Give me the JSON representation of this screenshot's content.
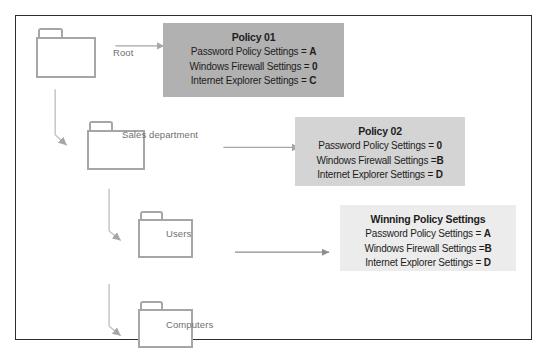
{
  "diagram": {
    "frame": {
      "border_color": "#2c2c2c",
      "background": "#ffffff"
    }
  },
  "tree": {
    "nodes": [
      {
        "id": "root",
        "icon": "folder-icon",
        "label": "Root"
      },
      {
        "id": "sales",
        "icon": "folder-icon",
        "label": "Sales department"
      },
      {
        "id": "users",
        "icon": "folder-icon",
        "label": "Users"
      },
      {
        "id": "computers",
        "icon": "folder-icon",
        "label": "Computers"
      }
    ]
  },
  "boxes": [
    {
      "id": "policy01",
      "title": "Policy 01",
      "background": "#b1b1b1",
      "lines": [
        {
          "setting": "Password Policy Settings = ",
          "value": "A"
        },
        {
          "setting": "Windows Firewall Settings = ",
          "value": "0"
        },
        {
          "setting": "Internet Explorer Settings = ",
          "value": "C"
        }
      ]
    },
    {
      "id": "policy02",
      "title": "Policy 02",
      "background": "#d4d4d4",
      "lines": [
        {
          "setting": "Password Policy Settings = ",
          "value": "0"
        },
        {
          "setting": "Windows Firewall Settings =",
          "value": "B"
        },
        {
          "setting": "Internet Explorer Settings = ",
          "value": "D"
        }
      ]
    },
    {
      "id": "winning",
      "title": "Winning Policy Settings",
      "background": "#ececec",
      "lines": [
        {
          "setting": "Password Policy Settings = ",
          "value": "A"
        },
        {
          "setting": "Windows Firewall Settings =",
          "value": "B"
        },
        {
          "setting": "Internet Explorer Settings = ",
          "value": "D"
        }
      ]
    }
  ],
  "connectors": {
    "arrow_color": "#a6a6a6",
    "tree_line_color": "#c0c0c0"
  }
}
